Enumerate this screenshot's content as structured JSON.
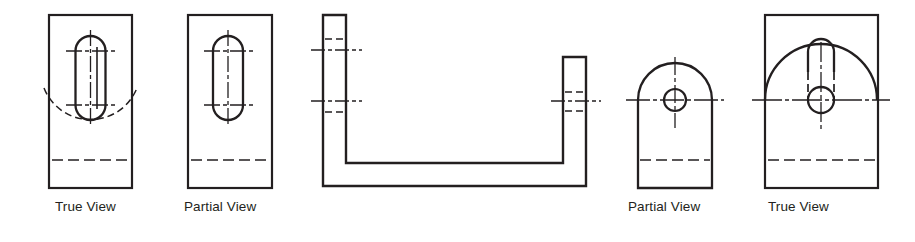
{
  "document": {
    "kind": "engineering-drawing-figure",
    "description": "Orthographic views of a channel-shaped part showing true views and partial (foreshortened) views of an angled face",
    "background_color": "#ffffff",
    "line_color": "#231f20",
    "canvas": {
      "width": 915,
      "height": 242
    }
  },
  "captions": [
    {
      "id": "caption-1",
      "text": "True View",
      "x": 55,
      "y": 205
    },
    {
      "id": "caption-2",
      "text": "Partial View",
      "x": 184,
      "y": 205
    },
    {
      "id": "caption-3",
      "text": "Partial View",
      "x": 628,
      "y": 205
    },
    {
      "id": "caption-4",
      "text": "True View",
      "x": 768,
      "y": 205
    }
  ],
  "figures": [
    {
      "id": "view-true-left",
      "label": "True View",
      "type": "rectangular-view-with-slot-and-hidden-arc",
      "outline": {
        "x": 49,
        "y": 15,
        "width": 83,
        "height": 173
      },
      "slot": {
        "cx": 90.5,
        "cy": 78,
        "width": 30,
        "top": 36,
        "bottom": 120,
        "radius": 15
      },
      "centers": [
        {
          "cx": 90.5,
          "cy": 51
        },
        {
          "cx": 90.5,
          "cy": 105
        }
      ],
      "hidden_arc": {
        "cx": 90.5,
        "cy": 103,
        "radius": 50,
        "start_deg": 200,
        "end_deg": 340
      },
      "hidden_line": {
        "x1": 52,
        "x2": 129,
        "y": 160
      }
    },
    {
      "id": "view-partial-left",
      "label": "Partial View",
      "type": "rectangular-view-with-slot",
      "outline": {
        "x": 188,
        "y": 15,
        "width": 84,
        "height": 173
      },
      "slot": {
        "cx": 228,
        "cy": 78,
        "width": 30,
        "top": 36,
        "bottom": 120,
        "radius": 15
      },
      "centers": [
        {
          "cx": 228,
          "cy": 51
        },
        {
          "cx": 228,
          "cy": 105
        }
      ],
      "hidden_line": {
        "x1": 191,
        "x2": 269,
        "y": 160
      }
    },
    {
      "id": "view-front-channel",
      "label": "",
      "type": "channel-front-view",
      "outer": {
        "left": 323,
        "right": 586,
        "top_left": 15,
        "top_right": 57,
        "bottom": 186
      },
      "thickness": 23,
      "inner_bottom": 163,
      "left_arm": {
        "centerlines": [
          {
            "y": 50,
            "x1": 311,
            "x2": 362
          },
          {
            "y": 101,
            "x1": 311,
            "x2": 362
          }
        ],
        "hidden_lines": [
          {
            "y": 39,
            "x1": 325,
            "x2": 344
          },
          {
            "y": 112,
            "x1": 325,
            "x2": 344
          }
        ]
      },
      "right_arm": {
        "centerlines": [
          {
            "y": 101,
            "x1": 551,
            "x2": 601
          }
        ],
        "hidden_lines": [
          {
            "y": 92,
            "x1": 565,
            "x2": 584
          },
          {
            "y": 111,
            "x1": 565,
            "x2": 584
          }
        ]
      }
    },
    {
      "id": "view-partial-right",
      "label": "Partial View",
      "type": "arched-view-with-hole",
      "outline": {
        "left": 638,
        "right": 712,
        "bottom": 188,
        "arc_center_y": 100,
        "arc_radius": 37
      },
      "hole": {
        "cx": 675,
        "cy": 100,
        "radius": 11
      },
      "centerlines": {
        "vertical": {
          "x": 675,
          "y1": 57,
          "y2": 128
        },
        "horizontal": {
          "y": 100,
          "x1": 626,
          "x2": 724
        }
      },
      "hidden_line": {
        "x1": 640,
        "x2": 710,
        "y": 160
      }
    },
    {
      "id": "view-true-right",
      "label": "True View",
      "type": "rectangular-view-with-arc-hole-and-slot",
      "outline": {
        "x": 765,
        "y": 15,
        "width": 113,
        "height": 173
      },
      "arc": {
        "cx": 821,
        "cy": 100,
        "radius": 56,
        "start_deg": 180,
        "end_deg": 360
      },
      "hole": {
        "cx": 821,
        "cy": 100,
        "radius": 13
      },
      "slot_tab": {
        "cx": 821,
        "cy": 52,
        "width": 26,
        "top": 39,
        "radius": 13
      },
      "hidden_verticals": [
        {
          "x": 809,
          "y1": 58,
          "y2": 100
        },
        {
          "x": 833,
          "y1": 58,
          "y2": 100
        }
      ],
      "centerlines": {
        "vertical": {
          "x": 821,
          "y1": 42,
          "y2": 130
        },
        "horizontal": {
          "y": 100,
          "x1": 752,
          "x2": 890
        }
      },
      "hidden_line": {
        "x1": 768,
        "x2": 875,
        "y": 160
      }
    }
  ]
}
